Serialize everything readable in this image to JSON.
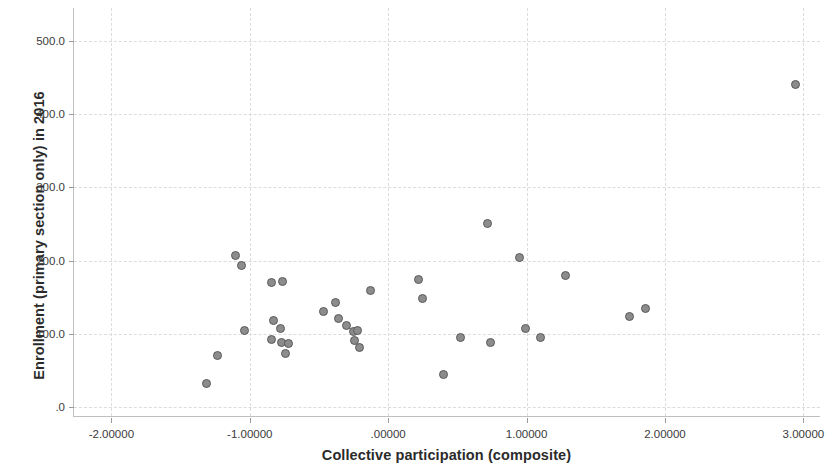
{
  "chart_data": {
    "type": "scatter",
    "title": "",
    "xlabel": "Collective participation (composite)",
    "ylabel": "Enrollment (primary section only) in 2016",
    "xlim": [
      -2.27,
      3.12
    ],
    "ylim": [
      -12,
      545
    ],
    "grid": true,
    "legend": null,
    "x_ticks": [
      -2,
      -1,
      0,
      1,
      2,
      3
    ],
    "x_tick_labels": [
      "-2.00000",
      "-1.00000",
      ".00000",
      "1.00000",
      "2.00000",
      "3.00000"
    ],
    "y_ticks": [
      0,
      100,
      200,
      300,
      400,
      500
    ],
    "y_tick_labels": [
      ".0",
      "100.0",
      "200.0",
      "300.0",
      "400.0",
      "500.0"
    ],
    "marker": {
      "shape": "circle",
      "fill": "#8c8c8c",
      "edge": "#5a5a5a",
      "size_px": 9
    },
    "points": [
      {
        "x": -1.31,
        "y": 33
      },
      {
        "x": -1.23,
        "y": 70
      },
      {
        "x": -1.1,
        "y": 207
      },
      {
        "x": -1.06,
        "y": 193
      },
      {
        "x": -1.04,
        "y": 105
      },
      {
        "x": -0.84,
        "y": 170
      },
      {
        "x": -0.76,
        "y": 171
      },
      {
        "x": -0.83,
        "y": 118
      },
      {
        "x": -0.84,
        "y": 92
      },
      {
        "x": -0.78,
        "y": 107
      },
      {
        "x": -0.77,
        "y": 88
      },
      {
        "x": -0.74,
        "y": 73
      },
      {
        "x": -0.72,
        "y": 87
      },
      {
        "x": -0.47,
        "y": 130
      },
      {
        "x": -0.38,
        "y": 143
      },
      {
        "x": -0.36,
        "y": 121
      },
      {
        "x": -0.3,
        "y": 111
      },
      {
        "x": -0.25,
        "y": 103
      },
      {
        "x": -0.24,
        "y": 91
      },
      {
        "x": -0.22,
        "y": 105
      },
      {
        "x": -0.21,
        "y": 82
      },
      {
        "x": -0.13,
        "y": 160
      },
      {
        "x": 0.22,
        "y": 174
      },
      {
        "x": 0.25,
        "y": 149
      },
      {
        "x": 0.4,
        "y": 45
      },
      {
        "x": 0.52,
        "y": 95
      },
      {
        "x": 0.72,
        "y": 251
      },
      {
        "x": 0.74,
        "y": 89
      },
      {
        "x": 0.95,
        "y": 205
      },
      {
        "x": 0.99,
        "y": 107
      },
      {
        "x": 1.1,
        "y": 95
      },
      {
        "x": 1.28,
        "y": 180
      },
      {
        "x": 1.74,
        "y": 124
      },
      {
        "x": 1.86,
        "y": 135
      },
      {
        "x": 2.94,
        "y": 440
      }
    ]
  }
}
